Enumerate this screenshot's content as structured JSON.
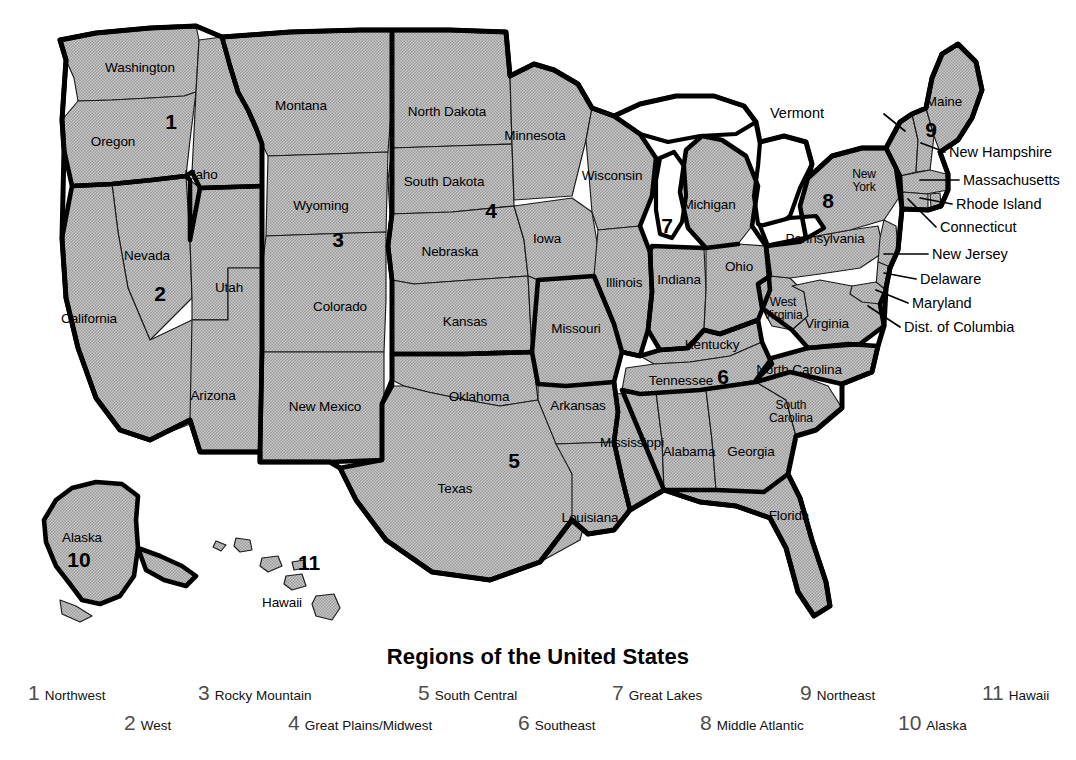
{
  "title": "Regions of the United States",
  "colors": {
    "state_fill": "#b4b4b4",
    "outline": "#000000",
    "background": "#ffffff",
    "legend_number": "#4d4d4d",
    "label_text": "#000000"
  },
  "map": {
    "region_numbers": [
      {
        "id": "1",
        "label": "1",
        "x": 171,
        "y": 122
      },
      {
        "id": "2",
        "label": "2",
        "x": 160,
        "y": 294
      },
      {
        "id": "3",
        "label": "3",
        "x": 338,
        "y": 240
      },
      {
        "id": "4",
        "label": "4",
        "x": 491,
        "y": 211
      },
      {
        "id": "5",
        "label": "5",
        "x": 514,
        "y": 461
      },
      {
        "id": "6",
        "label": "6",
        "x": 723,
        "y": 377
      },
      {
        "id": "7",
        "label": "7",
        "x": 667,
        "y": 226
      },
      {
        "id": "8",
        "label": "8",
        "x": 828,
        "y": 201
      },
      {
        "id": "9",
        "label": "9",
        "x": 931,
        "y": 130
      },
      {
        "id": "10",
        "label": "10",
        "x": 79,
        "y": 560
      },
      {
        "id": "11",
        "label": "11",
        "x": 309,
        "y": 563
      }
    ],
    "state_labels": [
      {
        "name": "Washington",
        "x": 140,
        "y": 68,
        "lines": [
          "Washington"
        ]
      },
      {
        "name": "Oregon",
        "x": 113,
        "y": 142,
        "lines": [
          "Oregon"
        ]
      },
      {
        "name": "Idaho",
        "x": 201,
        "y": 175,
        "lines": [
          "Idaho"
        ]
      },
      {
        "name": "Montana",
        "x": 301,
        "y": 106,
        "lines": [
          "Montana"
        ]
      },
      {
        "name": "Wyoming",
        "x": 321,
        "y": 206,
        "lines": [
          "Wyoming"
        ]
      },
      {
        "name": "Nevada",
        "x": 147,
        "y": 256,
        "lines": [
          "Nevada"
        ]
      },
      {
        "name": "Utah",
        "x": 229,
        "y": 288,
        "lines": [
          "Utah"
        ]
      },
      {
        "name": "California",
        "x": 89,
        "y": 319,
        "lines": [
          "California"
        ]
      },
      {
        "name": "Colorado",
        "x": 340,
        "y": 307,
        "lines": [
          "Colorado"
        ]
      },
      {
        "name": "Arizona",
        "x": 213,
        "y": 396,
        "lines": [
          "Arizona"
        ]
      },
      {
        "name": "New Mexico",
        "x": 325,
        "y": 407,
        "lines": [
          "New Mexico"
        ]
      },
      {
        "name": "North Dakota",
        "x": 447,
        "y": 112,
        "lines": [
          "North Dakota"
        ]
      },
      {
        "name": "South Dakota",
        "x": 444,
        "y": 182,
        "lines": [
          "South Dakota"
        ]
      },
      {
        "name": "Nebraska",
        "x": 450,
        "y": 252,
        "lines": [
          "Nebraska"
        ]
      },
      {
        "name": "Kansas",
        "x": 465,
        "y": 322,
        "lines": [
          "Kansas"
        ]
      },
      {
        "name": "Oklahoma",
        "x": 479,
        "y": 397,
        "lines": [
          "Oklahoma"
        ]
      },
      {
        "name": "Texas",
        "x": 455,
        "y": 489,
        "lines": [
          "Texas"
        ]
      },
      {
        "name": "Minnesota",
        "x": 535,
        "y": 136,
        "lines": [
          "Minnesota"
        ]
      },
      {
        "name": "Iowa",
        "x": 547,
        "y": 239,
        "lines": [
          "Iowa"
        ]
      },
      {
        "name": "Missouri",
        "x": 576,
        "y": 329,
        "lines": [
          "Missouri"
        ]
      },
      {
        "name": "Arkansas",
        "x": 578,
        "y": 406,
        "lines": [
          "Arkansas"
        ]
      },
      {
        "name": "Louisiana",
        "x": 590,
        "y": 518,
        "lines": [
          "Louisiana"
        ]
      },
      {
        "name": "Wisconsin",
        "x": 612,
        "y": 176,
        "lines": [
          "Wisconsin"
        ]
      },
      {
        "name": "Illinois",
        "x": 624,
        "y": 283,
        "lines": [
          "Illinois"
        ]
      },
      {
        "name": "Michigan",
        "x": 709,
        "y": 205,
        "lines": [
          "Michigan"
        ]
      },
      {
        "name": "Indiana",
        "x": 679,
        "y": 280,
        "lines": [
          "Indiana"
        ]
      },
      {
        "name": "Ohio",
        "x": 739,
        "y": 267,
        "lines": [
          "Ohio"
        ]
      },
      {
        "name": "Kentucky",
        "x": 712,
        "y": 345,
        "lines": [
          "Kentucky"
        ]
      },
      {
        "name": "Tennessee",
        "x": 681,
        "y": 381,
        "lines": [
          "Tennessee"
        ]
      },
      {
        "name": "Mississippi",
        "x": 632,
        "y": 443,
        "lines": [
          "Mississippi"
        ]
      },
      {
        "name": "Alabama",
        "x": 689,
        "y": 452,
        "lines": [
          "Alabama"
        ]
      },
      {
        "name": "Georgia",
        "x": 751,
        "y": 452,
        "lines": [
          "Georgia"
        ]
      },
      {
        "name": "Florida",
        "x": 789,
        "y": 516,
        "lines": [
          "Florida"
        ]
      },
      {
        "name": "South Carolina",
        "x": 791,
        "y": 412,
        "lines": [
          "South",
          "Carolina"
        ]
      },
      {
        "name": "North Carolina",
        "x": 799,
        "y": 370,
        "lines": [
          "North Carolina"
        ]
      },
      {
        "name": "West Virginia",
        "x": 783,
        "y": 309,
        "lines": [
          "West",
          "Virginia"
        ]
      },
      {
        "name": "Virginia",
        "x": 827,
        "y": 324,
        "lines": [
          "Virginia"
        ]
      },
      {
        "name": "Pennsylvania",
        "x": 825,
        "y": 239,
        "lines": [
          "Pennsylvania"
        ]
      },
      {
        "name": "New York",
        "x": 864,
        "y": 181,
        "lines": [
          "New",
          "York"
        ]
      },
      {
        "name": "Maine",
        "x": 944,
        "y": 102,
        "lines": [
          "Maine"
        ]
      },
      {
        "name": "Alaska",
        "x": 82,
        "y": 538,
        "lines": [
          "Alaska"
        ]
      },
      {
        "name": "Hawaii",
        "x": 282,
        "y": 603,
        "lines": [
          "Hawaii"
        ]
      }
    ],
    "callouts": [
      {
        "name": "Vermont",
        "text": "Vermont",
        "text_x": 824,
        "text_y": 113,
        "anchor": "end",
        "line": "M 884 114 L 905 131"
      },
      {
        "name": "New Hampshire",
        "text": "New Hampshire",
        "text_x": 949,
        "text_y": 152,
        "anchor": "start",
        "line": "M 945 152 L 921 143"
      },
      {
        "name": "Massachusetts",
        "text": "Massachusetts",
        "text_x": 963,
        "text_y": 180,
        "anchor": "start",
        "line": "M 959 180 L 920 180"
      },
      {
        "name": "Rhode Island",
        "text": "Rhode Island",
        "text_x": 956,
        "text_y": 204,
        "anchor": "start",
        "line": "M 952 204 L 920 198"
      },
      {
        "name": "Connecticut",
        "text": "Connecticut",
        "text_x": 940,
        "text_y": 227,
        "anchor": "start",
        "line": "M 936 227 L 908 199"
      },
      {
        "name": "New Jersey",
        "text": "New Jersey",
        "text_x": 932,
        "text_y": 254,
        "anchor": "start",
        "line": "M 928 254 L 884 254"
      },
      {
        "name": "Delaware",
        "text": "Delaware",
        "text_x": 920,
        "text_y": 279,
        "anchor": "start",
        "line": "M 916 279 L 884 273"
      },
      {
        "name": "Maryland",
        "text": "Maryland",
        "text_x": 912,
        "text_y": 303,
        "anchor": "start",
        "line": "M 908 303 L 876 290"
      },
      {
        "name": "Dist. of Columbia",
        "text": "Dist. of Columbia",
        "text_x": 904,
        "text_y": 327,
        "anchor": "start",
        "line": "M 900 327 L 868 306"
      }
    ]
  },
  "legend": {
    "items": [
      {
        "number": "1",
        "name": "Northwest",
        "x": 28,
        "y": 4
      },
      {
        "number": "2",
        "name": "West",
        "x": 124,
        "y": 34
      },
      {
        "number": "3",
        "name": "Rocky Mountain",
        "x": 198,
        "y": 4
      },
      {
        "number": "4",
        "name": "Great Plains/Midwest",
        "x": 288,
        "y": 34
      },
      {
        "number": "5",
        "name": "South Central",
        "x": 418,
        "y": 4
      },
      {
        "number": "6",
        "name": "Southeast",
        "x": 518,
        "y": 34
      },
      {
        "number": "7",
        "name": "Great Lakes",
        "x": 612,
        "y": 4
      },
      {
        "number": "8",
        "name": "Middle Atlantic",
        "x": 700,
        "y": 34
      },
      {
        "number": "9",
        "name": "Northeast",
        "x": 800,
        "y": 4
      },
      {
        "number": "10",
        "name": "Alaska",
        "x": 898,
        "y": 34
      },
      {
        "number": "11",
        "name": "Hawaii",
        "x": 982,
        "y": 4
      }
    ]
  }
}
